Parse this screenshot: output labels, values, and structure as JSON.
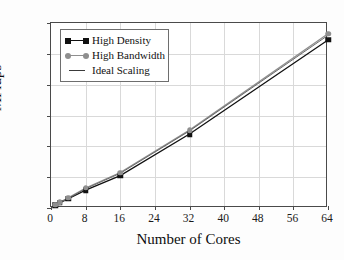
{
  "chart_data": {
    "type": "line",
    "title": "",
    "xlabel": "Number of Cores",
    "ylabel": "MFlups",
    "xlim": [
      0,
      64
    ],
    "ylim": [
      0,
      120
    ],
    "xticks": [
      0,
      8,
      16,
      24,
      32,
      40,
      48,
      56,
      64
    ],
    "yticks": [
      0,
      20,
      40,
      60,
      80,
      100,
      120
    ],
    "grid": true,
    "legend_position": "upper-left",
    "x": [
      1,
      2,
      4,
      8,
      16,
      32,
      64
    ],
    "series": [
      {
        "name": "High Density",
        "marker": "square",
        "color": "#111111",
        "values": [
          1.8,
          3.3,
          6.0,
          11.6,
          21.0,
          48.0,
          109.0
        ]
      },
      {
        "name": "High Bandwidth",
        "marker": "circle",
        "color": "#8f8f8f",
        "values": [
          2.0,
          3.7,
          6.6,
          13.0,
          23.0,
          50.5,
          113.0
        ]
      },
      {
        "name": "Ideal Scaling",
        "marker": "none",
        "color": "#5a5a5a",
        "values": [
          1.9,
          3.5,
          6.3,
          12.5,
          22.5,
          50.0,
          112.0
        ]
      }
    ]
  },
  "legend": {
    "items": [
      {
        "label": "High Density",
        "key": "line-square-marker"
      },
      {
        "label": "High Bandwidth",
        "key": "line-circle-marker"
      },
      {
        "label": "Ideal Scaling",
        "key": "plain-line"
      }
    ]
  },
  "axes": {
    "x_title": "Number of Cores",
    "y_title": "MFlups",
    "x_tick_labels": [
      "0",
      "8",
      "16",
      "24",
      "32",
      "40",
      "48",
      "56",
      "64"
    ],
    "y_tick_labels": [
      "0",
      "20",
      "40",
      "60",
      "80",
      "100",
      "120"
    ]
  },
  "colors": {
    "frame": "#4a4a4a",
    "grid": "#d9d9d9",
    "series_high_density": "#111111",
    "series_high_bandwidth": "#8f8f8f",
    "series_ideal": "#5a5a5a",
    "background": "#ffffff"
  }
}
